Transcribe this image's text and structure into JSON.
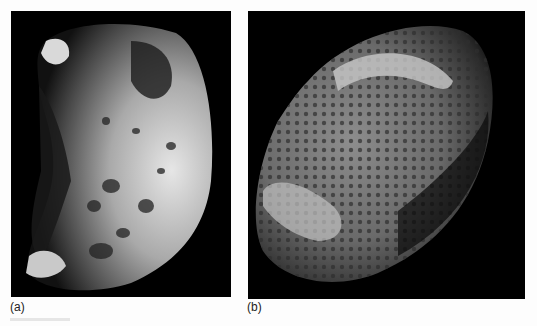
{
  "figure": {
    "panels": [
      {
        "id": "a",
        "label": "(a)",
        "subject": "irregular cratered moon, lit from right",
        "background": "#000000"
      },
      {
        "id": "b",
        "label": "(b)",
        "subject": "sponge-like porous moon, oblong, tilted",
        "background": "#000000"
      }
    ],
    "page_background": "#fdfdfd"
  }
}
